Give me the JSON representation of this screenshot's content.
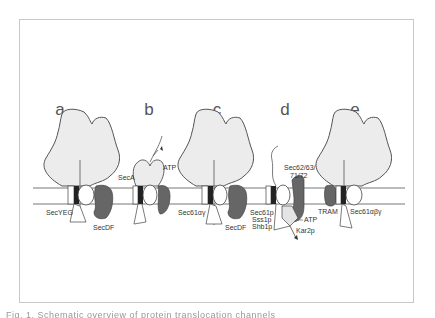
{
  "figure": {
    "panels": [
      {
        "letter": "a",
        "labels": [
          "SecYEG",
          "SecDF"
        ]
      },
      {
        "letter": "b",
        "labels": [
          "SecA",
          "ATP"
        ]
      },
      {
        "letter": "c",
        "labels": [
          "Sec61αγ",
          "SecDF"
        ]
      },
      {
        "letter": "d",
        "labels": [
          "Sec62/63/",
          "71/72",
          "Sec61p",
          "Sss1p",
          "Shb1p",
          "ATP",
          "Kar2p"
        ]
      },
      {
        "letter": "e",
        "labels": [
          "TRAM",
          "Sec61αβγ"
        ]
      }
    ],
    "caption_clipped": "Fig. 1. Schematic overview of protein translocation channels"
  },
  "colors": {
    "ribosome_fill": "#ececec",
    "outline": "#555555",
    "dark_protein": "#666666",
    "channel_dark": "#333333",
    "membrane_line": "#777777",
    "frame": "#c8c8c8"
  }
}
